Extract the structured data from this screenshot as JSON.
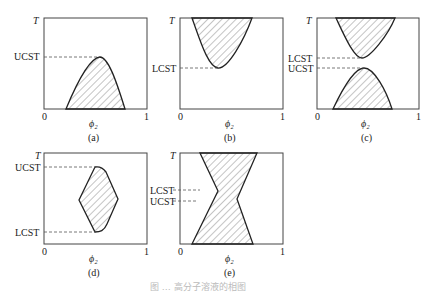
{
  "figure": {
    "caption": "图 … 高分子溶液的相图",
    "panels": [
      {
        "id": "a",
        "label": "(a)",
        "y_axis": "T",
        "x_axis": "ϕ₂",
        "x_ticks": [
          "0",
          "1"
        ],
        "markers": [
          {
            "name": "UCST"
          }
        ],
        "description": "Single miscibility gap below UCST (hatched dome at bottom)"
      },
      {
        "id": "b",
        "label": "(b)",
        "y_axis": "T",
        "x_axis": "ϕ₂",
        "x_ticks": [
          "0",
          "1"
        ],
        "markers": [
          {
            "name": "LCST"
          }
        ],
        "description": "Miscibility gap above LCST (hatched inverted dome at top)"
      },
      {
        "id": "c",
        "label": "(c)",
        "y_axis": "T",
        "x_axis": "ϕ₂",
        "x_ticks": [
          "0",
          "1"
        ],
        "markers": [
          {
            "name": "LCST"
          },
          {
            "name": "UCST"
          }
        ],
        "description": "Both gaps, LCST above UCST"
      },
      {
        "id": "d",
        "label": "(d)",
        "y_axis": "T",
        "x_axis": "ϕ₂",
        "x_ticks": [
          "0",
          "1"
        ],
        "markers": [
          {
            "name": "UCST"
          },
          {
            "name": "LCST"
          }
        ],
        "description": "Closed-loop miscibility gap between LCST (bottom) and UCST (top)"
      },
      {
        "id": "e",
        "label": "(e)",
        "y_axis": "T",
        "x_axis": "ϕ₂",
        "x_ticks": [
          "0",
          "1"
        ],
        "markers": [
          {
            "name": "LCST"
          },
          {
            "name": "UCST"
          }
        ],
        "description": "Hourglass-shaped gap where LCST lies below UCST"
      }
    ]
  }
}
